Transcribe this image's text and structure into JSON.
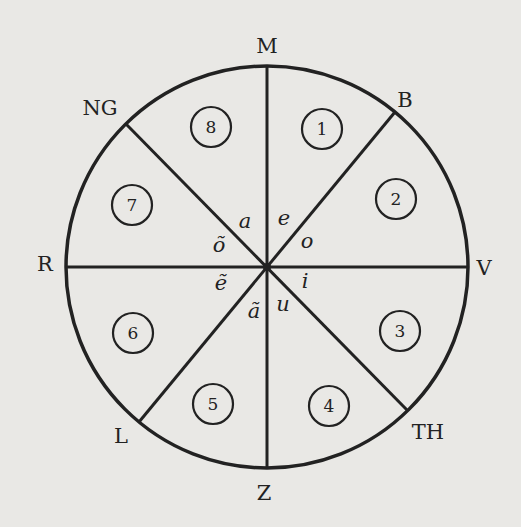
{
  "diagram": {
    "type": "circular sector diagram",
    "colors": {
      "background": "#e9e8e5",
      "ink": "#222222"
    },
    "circle": {
      "cx": 267,
      "cy": 267,
      "r": 201
    },
    "outer_labels": [
      {
        "id": "M",
        "text": "M",
        "x": 267,
        "y": 53
      },
      {
        "id": "B",
        "text": "B",
        "x": 405,
        "y": 107
      },
      {
        "id": "V",
        "text": "V",
        "x": 484,
        "y": 275
      },
      {
        "id": "TH",
        "text": "TH",
        "x": 428,
        "y": 439
      },
      {
        "id": "Z",
        "text": "Z",
        "x": 264,
        "y": 500
      },
      {
        "id": "L",
        "text": "L",
        "x": 121,
        "y": 443
      },
      {
        "id": "R",
        "text": "R",
        "x": 45,
        "y": 271
      },
      {
        "id": "NG",
        "text": "NG",
        "x": 100,
        "y": 115
      }
    ],
    "sector_numbers": [
      {
        "text": "1",
        "x": 322,
        "y": 129
      },
      {
        "text": "2",
        "x": 396,
        "y": 199
      },
      {
        "text": "3",
        "x": 400,
        "y": 331
      },
      {
        "text": "4",
        "x": 329,
        "y": 406
      },
      {
        "text": "5",
        "x": 213,
        "y": 404
      },
      {
        "text": "6",
        "x": 133,
        "y": 333
      },
      {
        "text": "7",
        "x": 132,
        "y": 205
      },
      {
        "text": "8",
        "x": 211,
        "y": 127
      }
    ],
    "vowels": [
      {
        "text": "a",
        "x": 245,
        "y": 228
      },
      {
        "text": "e",
        "x": 284,
        "y": 225
      },
      {
        "text": "o",
        "x": 307,
        "y": 248
      },
      {
        "text": "i",
        "x": 305,
        "y": 288
      },
      {
        "text": "u",
        "x": 283,
        "y": 311
      },
      {
        "text": "ã",
        "x": 254,
        "y": 318
      },
      {
        "text": "ẽ",
        "x": 221,
        "y": 290
      },
      {
        "text": "õ",
        "x": 219,
        "y": 252
      }
    ]
  }
}
